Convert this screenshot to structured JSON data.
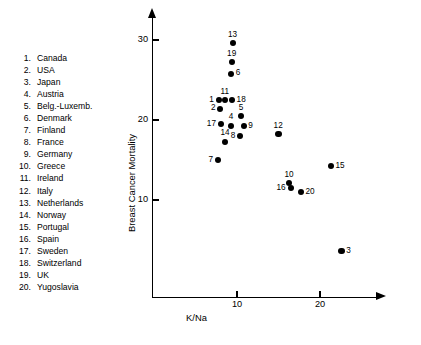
{
  "legend": {
    "items": [
      {
        "num": "1.",
        "name": "Canada"
      },
      {
        "num": "2.",
        "name": "USA"
      },
      {
        "num": "3.",
        "name": "Japan"
      },
      {
        "num": "4.",
        "name": "Austria"
      },
      {
        "num": "5.",
        "name": "Belg.-Luxemb."
      },
      {
        "num": "6.",
        "name": "Denmark"
      },
      {
        "num": "7.",
        "name": "Finland"
      },
      {
        "num": "8.",
        "name": "France"
      },
      {
        "num": "9.",
        "name": "Germany"
      },
      {
        "num": "10.",
        "name": "Greece"
      },
      {
        "num": "11.",
        "name": "Ireland"
      },
      {
        "num": "12.",
        "name": "Italy"
      },
      {
        "num": "13.",
        "name": "Netherlands"
      },
      {
        "num": "14.",
        "name": "Norway"
      },
      {
        "num": "15.",
        "name": "Portugal"
      },
      {
        "num": "16.",
        "name": "Spain"
      },
      {
        "num": "17.",
        "name": "Sweden"
      },
      {
        "num": "18.",
        "name": "Switzerland"
      },
      {
        "num": "19.",
        "name": "UK"
      },
      {
        "num": "20.",
        "name": "Yugoslavia"
      }
    ]
  },
  "chart_data": {
    "type": "scatter",
    "title": "",
    "xlabel": "K/Na",
    "ylabel": "Breast Cancer Mortality",
    "xticks": [
      10,
      20
    ],
    "yticks": [
      10,
      20,
      30
    ],
    "xlim": [
      4.2,
      27.2
    ],
    "ylim": [
      1.6,
      31.5
    ],
    "grid": false,
    "legend_position": "left-outside",
    "marker": "filled-circle",
    "marker_color": "#000000",
    "point_labels_shown": true,
    "points": [
      {
        "label": "1",
        "name": "Canada",
        "x": 7.8,
        "y": 22.5,
        "label_pos": "left"
      },
      {
        "label": "2",
        "name": "USA",
        "x": 8.0,
        "y": 21.4,
        "label_pos": "left"
      },
      {
        "label": "3",
        "name": "Japan",
        "x": 22.6,
        "y": 3.6,
        "label_pos": "right"
      },
      {
        "label": "4",
        "name": "Austria",
        "x": 9.3,
        "y": 19.3,
        "label_pos": "above"
      },
      {
        "label": "5",
        "name": "Belg.-Luxemb.",
        "x": 10.5,
        "y": 20.5,
        "label_pos": "above"
      },
      {
        "label": "6",
        "name": "Denmark",
        "x": 9.3,
        "y": 25.8,
        "label_pos": "right"
      },
      {
        "label": "7",
        "name": "Finland",
        "x": 7.7,
        "y": 15.0,
        "label_pos": "left"
      },
      {
        "label": "8",
        "name": "France",
        "x": 10.4,
        "y": 18.0,
        "label_pos": "left"
      },
      {
        "label": "9",
        "name": "Germany",
        "x": 10.8,
        "y": 19.2,
        "label_pos": "right"
      },
      {
        "label": "10",
        "name": "Greece",
        "x": 16.3,
        "y": 12.1,
        "label_pos": "above"
      },
      {
        "label": "11",
        "name": "Ireland",
        "x": 8.6,
        "y": 22.5,
        "label_pos": "above"
      },
      {
        "label": "12",
        "name": "Italy",
        "x": 15.0,
        "y": 18.2,
        "label_pos": "above"
      },
      {
        "label": "13",
        "name": "Netherlands",
        "x": 9.5,
        "y": 29.6,
        "label_pos": "above"
      },
      {
        "label": "14",
        "name": "Norway",
        "x": 8.6,
        "y": 17.3,
        "label_pos": "above"
      },
      {
        "label": "15",
        "name": "Portugal",
        "x": 21.3,
        "y": 14.2,
        "label_pos": "right"
      },
      {
        "label": "16",
        "name": "Spain",
        "x": 16.5,
        "y": 11.5,
        "label_pos": "left"
      },
      {
        "label": "17",
        "name": "Sweden",
        "x": 8.1,
        "y": 19.5,
        "label_pos": "left"
      },
      {
        "label": "18",
        "name": "Switzerland",
        "x": 9.4,
        "y": 22.5,
        "label_pos": "right"
      },
      {
        "label": "19",
        "name": "UK",
        "x": 9.4,
        "y": 27.2,
        "label_pos": "above"
      },
      {
        "label": "20",
        "name": "Yugoslavia",
        "x": 17.7,
        "y": 11.0,
        "label_pos": "right"
      }
    ]
  }
}
